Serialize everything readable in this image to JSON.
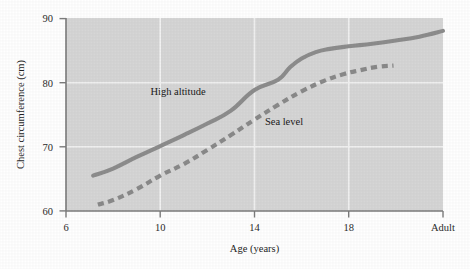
{
  "chart_data": {
    "type": "line",
    "title": "",
    "xlabel": "Age (years)",
    "ylabel": "Chest circumference (cm)",
    "xlim": [
      6,
      22
    ],
    "ylim": [
      60,
      90
    ],
    "xticks": [
      6,
      10,
      14,
      18,
      22
    ],
    "xtick_labels": [
      "6",
      "10",
      "14",
      "18",
      "Adult"
    ],
    "yticks": [
      60,
      70,
      80,
      90
    ],
    "ytick_labels": [
      "60",
      "70",
      "80",
      "90"
    ],
    "grid": "horizontal-and-vertical",
    "legend_position": "in-plot-annotations",
    "plot_bgcolor": "#d6d6d6",
    "gridline_color": "#f2f2f2",
    "axis_color": "#7c7c7c",
    "series": [
      {
        "name": "High altitude",
        "style": "solid",
        "color": "#8d8d8d",
        "label_text": "High altitude",
        "x": [
          7.15,
          8,
          9,
          10,
          11,
          12,
          13,
          14,
          15,
          15.5,
          16,
          16.6,
          17.2,
          18,
          19,
          20,
          21,
          22
        ],
        "y": [
          65.5,
          66.6,
          68.4,
          70.1,
          71.8,
          73.6,
          75.6,
          78.8,
          80.4,
          82.3,
          83.7,
          84.7,
          85.2,
          85.6,
          86.0,
          86.5,
          87.1,
          88.0
        ]
      },
      {
        "name": "Sea level",
        "style": "dashed",
        "color": "#8a8a8a",
        "label_text": "Sea level",
        "x": [
          7.35,
          8,
          9,
          10,
          11,
          12,
          13,
          14,
          15,
          16,
          17,
          17.8,
          18.5,
          19.2,
          19.9
        ],
        "y": [
          61.0,
          61.7,
          63.4,
          65.5,
          67.3,
          69.5,
          71.8,
          74.2,
          76.5,
          78.6,
          80.3,
          81.3,
          81.9,
          82.4,
          82.6
        ]
      }
    ],
    "annotations": [
      {
        "text": "High altitude",
        "x": 11.1,
        "y": 79.6
      },
      {
        "text": "Sea level",
        "x": 15.1,
        "y": 75.0
      }
    ]
  }
}
